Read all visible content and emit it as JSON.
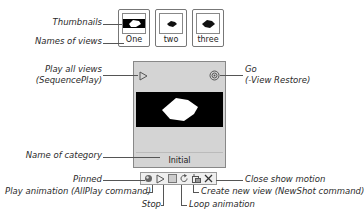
{
  "thumbnails": [
    {
      "name": "One",
      "style": "black-band"
    },
    {
      "name": "two",
      "style": "white"
    },
    {
      "name": "three",
      "style": "white"
    }
  ],
  "panel": {
    "category_name": "Initial",
    "play_all_icon": "play-outline-icon",
    "go_icon": "target-circle-icon"
  },
  "toolbar": {
    "buttons": [
      {
        "icon": "pin-icon",
        "label": "Pinned"
      },
      {
        "icon": "play-icon",
        "label": "Play animation (AllPlay command)"
      },
      {
        "icon": "stop-icon",
        "label": "Stop"
      },
      {
        "icon": "loop-icon",
        "label": "Loop animation"
      },
      {
        "icon": "new-view-icon",
        "label": "Create new view (NewShot command)"
      },
      {
        "icon": "close-icon",
        "label": "Close show motion"
      }
    ]
  },
  "callouts": {
    "thumbnails": "Thumbnails",
    "names_of_views": "Names of views",
    "play_all_line1": "Play all views",
    "play_all_line2": "(SequencePlay)",
    "go_line1": "Go",
    "go_line2": "(-View Restore)",
    "name_of_category": "Name of category",
    "pinned": "Pinned",
    "play_animation": "Play animation (AllPlay command)",
    "stop": "Stop",
    "loop_animation": "Loop animation",
    "create_new_view": "Create new view (NewShot command)",
    "close_show_motion": "Close show motion"
  }
}
